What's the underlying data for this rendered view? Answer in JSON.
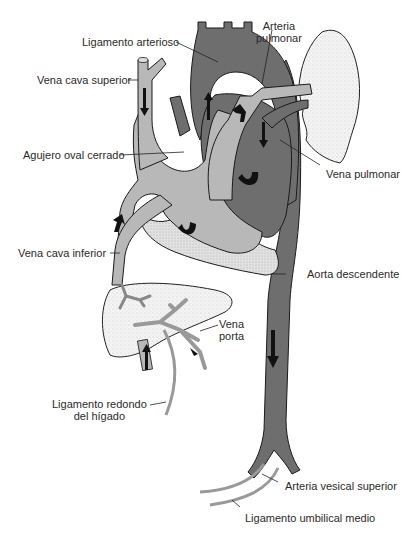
{
  "figure": {
    "type": "anatomical-diagram",
    "colors": {
      "oxygenated_dark": "#6e6e6e",
      "venous_light": "#b8b8b8",
      "outline": "#1a1a1a",
      "lung_liver_fill": "#f2f2f2",
      "pericardium_stipple": "#dcdcdc",
      "arrows": "#111111"
    }
  },
  "labels": {
    "ligamento_arterioso": "Ligamento arterioso",
    "arteria_pulmonar_1": "Arteria",
    "arteria_pulmonar_2": "pulmonar",
    "vena_cava_superior": "Vena cava superior",
    "agujero_oval": "Agujero oval cerrado",
    "vena_pulmonar": "Vena pulmonar",
    "vena_cava_inferior": "Vena cava inferior",
    "aorta_descendente": "Aorta descendente",
    "vena_porta_1": "Vena",
    "vena_porta_2": "porta",
    "ligamento_redondo_1": "Ligamento redondo",
    "ligamento_redondo_2": "del hígado",
    "arteria_vesical": "Arteria vesical superior",
    "ligamento_umbilical": "Ligamento umbilical medio"
  }
}
